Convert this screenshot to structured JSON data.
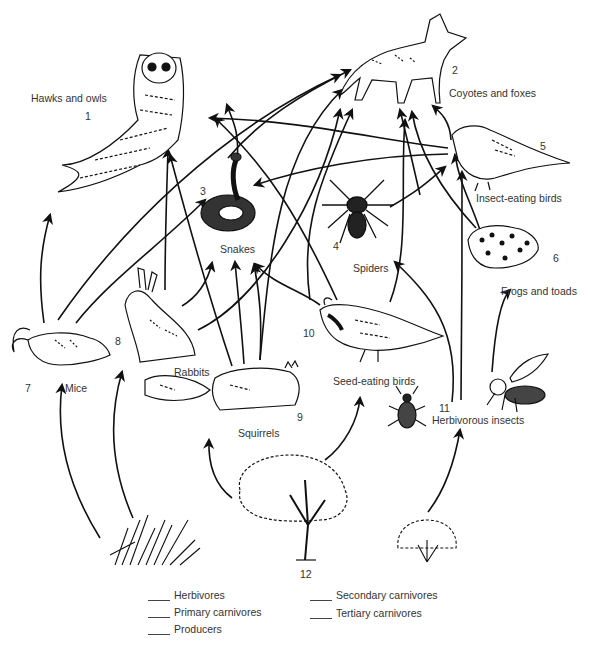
{
  "organisms": [
    {
      "id": 1,
      "label": "Hawks and owls",
      "number": "1",
      "icon": "owl-icon"
    },
    {
      "id": 2,
      "label": "Coyotes and foxes",
      "number": "2",
      "icon": "coyote-icon"
    },
    {
      "id": 3,
      "label": "Snakes",
      "number": "3",
      "icon": "snake-icon"
    },
    {
      "id": 4,
      "label": "Spiders",
      "number": "4",
      "icon": "spider-icon"
    },
    {
      "id": 5,
      "label": "Insect-eating birds",
      "number": "5",
      "icon": "songbird-icon"
    },
    {
      "id": 6,
      "label": "Frogs and toads",
      "number": "6",
      "icon": "frog-icon"
    },
    {
      "id": 7,
      "label": "Mice",
      "number": "7",
      "icon": "mouse-icon"
    },
    {
      "id": 8,
      "label": "Rabbits",
      "number": "8",
      "icon": "rabbit-icon"
    },
    {
      "id": 9,
      "label": "Squirrels",
      "number": "9",
      "icon": "squirrel-icon"
    },
    {
      "id": 10,
      "label": "Seed-eating birds",
      "number": "10",
      "icon": "quail-icon"
    },
    {
      "id": 11,
      "label": "Herbivorous insects",
      "number": "11",
      "icon": "beetle-bee-icon"
    },
    {
      "id": 12,
      "label": "",
      "number": "12",
      "icon": "tree-icon"
    }
  ],
  "producers_unlabeled": [
    {
      "icon": "grass-icon"
    },
    {
      "icon": "shrub-icon"
    }
  ],
  "legend": {
    "left": [
      "Herbivores",
      "Primary carnivores",
      "Producers"
    ],
    "right": [
      "Secondary carnivores",
      "Tertiary carnivores"
    ]
  },
  "colors": {
    "ink": "#1a1a1a",
    "text": "#333333",
    "background": "#ffffff"
  }
}
